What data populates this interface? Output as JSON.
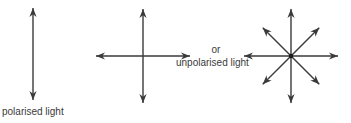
{
  "diagram": {
    "labels": {
      "polarised": "polarised light",
      "or": "or",
      "unpolarised": "unpolarised light"
    },
    "stroke_color": "#3a3a3a",
    "figures": [
      {
        "name": "polarised-light",
        "directions_deg": [
          90
        ]
      },
      {
        "name": "unpolarised-light-cross",
        "directions_deg": [
          0,
          90
        ]
      },
      {
        "name": "unpolarised-light-star",
        "directions_deg": [
          0,
          45,
          90,
          135
        ]
      }
    ]
  }
}
